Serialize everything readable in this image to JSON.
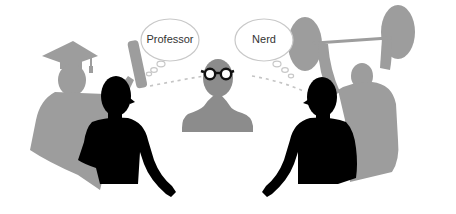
{
  "illustration": {
    "bubbles": [
      {
        "label": "Professor"
      },
      {
        "label": "Nerd"
      }
    ],
    "colors": {
      "silhouette": "#000000",
      "shadow": "#9b9b9b",
      "center_figure": "#8c8c8c",
      "bubble_stroke": "#c8c8c8",
      "dashed_line": "#c0c0c0",
      "background": "#ffffff"
    }
  }
}
